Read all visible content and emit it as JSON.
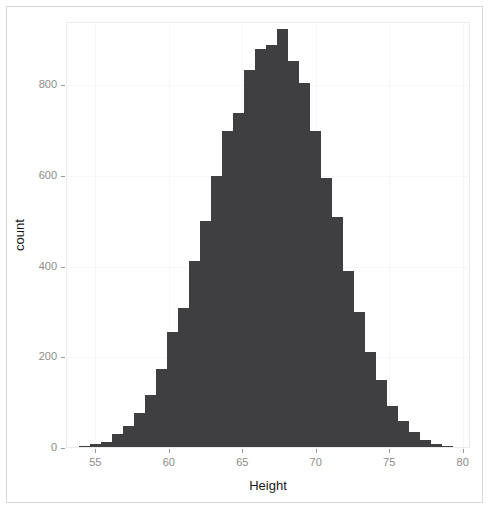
{
  "chart_data": {
    "type": "bar",
    "chart_subtype": "histogram",
    "title": "",
    "xlabel": "Height",
    "ylabel": "count",
    "xlim": [
      53.0,
      80.5
    ],
    "ylim": [
      0,
      940
    ],
    "grid": false,
    "legend": null,
    "bin_width": 0.75,
    "bar_color": "#3f3f42",
    "panel_background": "#ffffff",
    "panel_border_color": "#ececec",
    "axis_text_color": "#8c8c8c",
    "axis_title_color": "#1a1a1a",
    "xticks": [
      55,
      60,
      65,
      70,
      75,
      80
    ],
    "xtick_labels": [
      "55",
      "60",
      "65",
      "70",
      "75",
      "80"
    ],
    "yticks": [
      0,
      200,
      400,
      600,
      800
    ],
    "ytick_labels": [
      "0",
      "200",
      "400",
      "600",
      "800"
    ],
    "bins": [
      {
        "x": 53.5,
        "count": 0
      },
      {
        "x": 54.25,
        "count": 4
      },
      {
        "x": 55.0,
        "count": 8
      },
      {
        "x": 55.75,
        "count": 14
      },
      {
        "x": 56.5,
        "count": 30
      },
      {
        "x": 57.25,
        "count": 48
      },
      {
        "x": 58.0,
        "count": 78
      },
      {
        "x": 58.75,
        "count": 118
      },
      {
        "x": 59.5,
        "count": 175
      },
      {
        "x": 60.25,
        "count": 255
      },
      {
        "x": 61.0,
        "count": 310
      },
      {
        "x": 61.75,
        "count": 412
      },
      {
        "x": 62.5,
        "count": 500
      },
      {
        "x": 63.25,
        "count": 600
      },
      {
        "x": 64.0,
        "count": 700
      },
      {
        "x": 64.75,
        "count": 740
      },
      {
        "x": 65.5,
        "count": 835
      },
      {
        "x": 66.25,
        "count": 880
      },
      {
        "x": 67.0,
        "count": 890
      },
      {
        "x": 67.75,
        "count": 925
      },
      {
        "x": 68.5,
        "count": 855
      },
      {
        "x": 69.25,
        "count": 805
      },
      {
        "x": 70.0,
        "count": 700
      },
      {
        "x": 70.75,
        "count": 595
      },
      {
        "x": 71.5,
        "count": 510
      },
      {
        "x": 72.25,
        "count": 390
      },
      {
        "x": 73.0,
        "count": 300
      },
      {
        "x": 73.75,
        "count": 212
      },
      {
        "x": 74.5,
        "count": 150
      },
      {
        "x": 75.25,
        "count": 92
      },
      {
        "x": 76.0,
        "count": 60
      },
      {
        "x": 76.75,
        "count": 35
      },
      {
        "x": 77.5,
        "count": 18
      },
      {
        "x": 78.25,
        "count": 9
      },
      {
        "x": 79.0,
        "count": 4
      },
      {
        "x": 79.75,
        "count": 1
      }
    ]
  }
}
